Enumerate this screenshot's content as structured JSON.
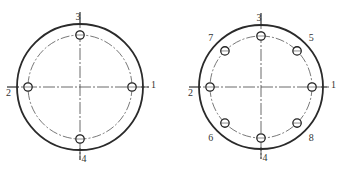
{
  "figures": [
    {
      "name": "four-bolt-flange",
      "bolt_count": 4,
      "bolts": [
        {
          "label": "1",
          "angle_deg": 0
        },
        {
          "label": "2",
          "angle_deg": 180
        },
        {
          "label": "3",
          "angle_deg": 90
        },
        {
          "label": "4",
          "angle_deg": 270
        }
      ]
    },
    {
      "name": "eight-bolt-flange",
      "bolt_count": 8,
      "bolts": [
        {
          "label": "1",
          "angle_deg": 0
        },
        {
          "label": "2",
          "angle_deg": 180
        },
        {
          "label": "3",
          "angle_deg": 90
        },
        {
          "label": "4",
          "angle_deg": 270
        },
        {
          "label": "5",
          "angle_deg": 45
        },
        {
          "label": "6",
          "angle_deg": 225
        },
        {
          "label": "7",
          "angle_deg": 135
        },
        {
          "label": "8",
          "angle_deg": 315
        }
      ]
    }
  ],
  "colors": {
    "line": "#2a2a2a",
    "background": "#ffffff"
  }
}
